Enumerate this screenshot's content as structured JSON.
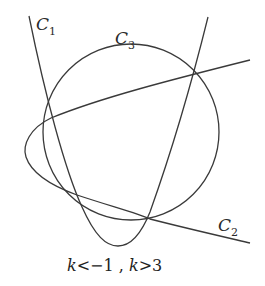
{
  "diagram": {
    "curves": [
      {
        "id": "C1",
        "label": "C",
        "subscript": "1",
        "type": "parabola-opening-up"
      },
      {
        "id": "C2",
        "label": "C",
        "subscript": "2",
        "type": "parabola-opening-right"
      },
      {
        "id": "C3",
        "label": "C",
        "subscript": "3",
        "type": "circle"
      }
    ],
    "intersection_points": 4,
    "condition": {
      "var1": "k",
      "op1": "<",
      "val1": "−1",
      "separator": " , ",
      "var2": "k",
      "op2": ">",
      "val2": "3"
    },
    "stroke_color": "#3a3a3a"
  }
}
